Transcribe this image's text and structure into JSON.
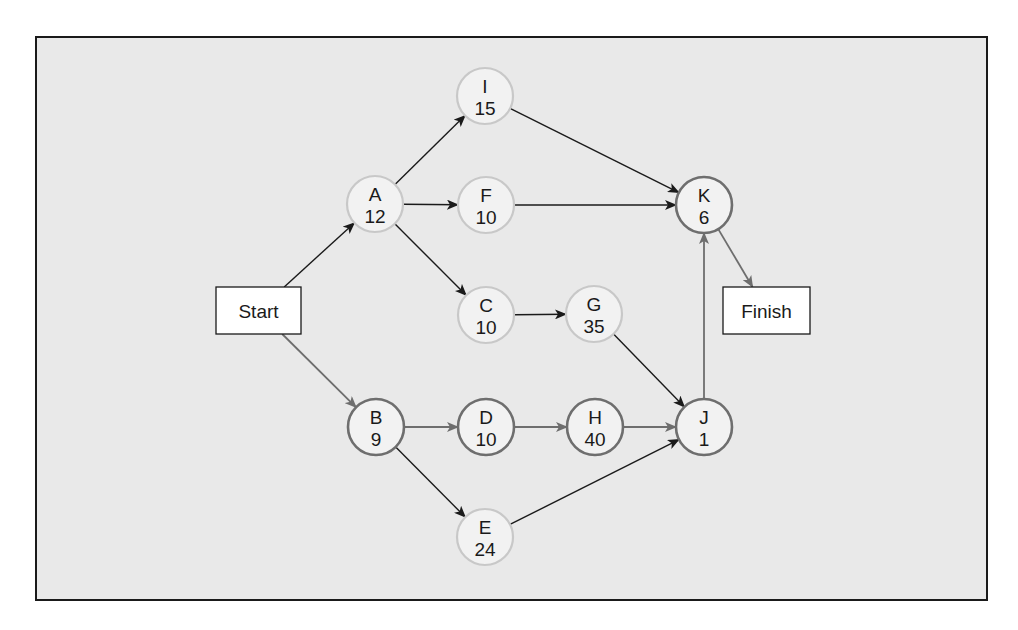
{
  "diagram": {
    "type": "network-diagram",
    "title": "",
    "colors": {
      "background": "#e9e9e9",
      "frame_border": "#1a1a1a",
      "node_fill": "#f2f2f2",
      "normal_node_border": "#c8c8c8",
      "critical_node_border": "#6e6e6e",
      "normal_arrow": "#1a1a1a",
      "critical_arrow": "#6e6e6e",
      "text": "#1a1a1a"
    },
    "terminals": [
      {
        "id": "start",
        "label": "Start",
        "x": 216,
        "y": 287,
        "w": 85,
        "h": 47
      },
      {
        "id": "finish",
        "label": "Finish",
        "x": 723,
        "y": 287,
        "w": 87,
        "h": 47
      }
    ],
    "nodes": [
      {
        "id": "A",
        "label": "A",
        "duration": "12",
        "cx": 375,
        "cy": 204,
        "critical": false
      },
      {
        "id": "I",
        "label": "I",
        "duration": "15",
        "cx": 485,
        "cy": 96,
        "critical": false
      },
      {
        "id": "F",
        "label": "F",
        "duration": "10",
        "cx": 486,
        "cy": 205,
        "critical": false
      },
      {
        "id": "C",
        "label": "C",
        "duration": "10",
        "cx": 486,
        "cy": 315,
        "critical": false
      },
      {
        "id": "G",
        "label": "G",
        "duration": "35",
        "cx": 594,
        "cy": 314,
        "critical": false
      },
      {
        "id": "K",
        "label": "K",
        "duration": "6",
        "cx": 704,
        "cy": 205,
        "critical": true
      },
      {
        "id": "B",
        "label": "B",
        "duration": "9",
        "cx": 376,
        "cy": 427,
        "critical": true
      },
      {
        "id": "D",
        "label": "D",
        "duration": "10",
        "cx": 486,
        "cy": 427,
        "critical": true
      },
      {
        "id": "H",
        "label": "H",
        "duration": "40",
        "cx": 595,
        "cy": 427,
        "critical": true
      },
      {
        "id": "J",
        "label": "J",
        "duration": "1",
        "cx": 704,
        "cy": 427,
        "critical": true
      },
      {
        "id": "E",
        "label": "E",
        "duration": "24",
        "cx": 485,
        "cy": 537,
        "critical": false
      }
    ],
    "edges": [
      {
        "from": "start",
        "to": "A",
        "critical": false
      },
      {
        "from": "start",
        "to": "B",
        "critical": true
      },
      {
        "from": "A",
        "to": "I",
        "critical": false
      },
      {
        "from": "A",
        "to": "F",
        "critical": false
      },
      {
        "from": "A",
        "to": "C",
        "critical": false
      },
      {
        "from": "I",
        "to": "K",
        "critical": false
      },
      {
        "from": "F",
        "to": "K",
        "critical": false
      },
      {
        "from": "C",
        "to": "G",
        "critical": false
      },
      {
        "from": "G",
        "to": "J",
        "critical": false
      },
      {
        "from": "B",
        "to": "D",
        "critical": true
      },
      {
        "from": "B",
        "to": "E",
        "critical": false
      },
      {
        "from": "D",
        "to": "H",
        "critical": true
      },
      {
        "from": "H",
        "to": "J",
        "critical": true
      },
      {
        "from": "E",
        "to": "J",
        "critical": false
      },
      {
        "from": "J",
        "to": "K",
        "critical": true
      },
      {
        "from": "K",
        "to": "finish",
        "critical": true
      }
    ],
    "node_radius": 28
  }
}
